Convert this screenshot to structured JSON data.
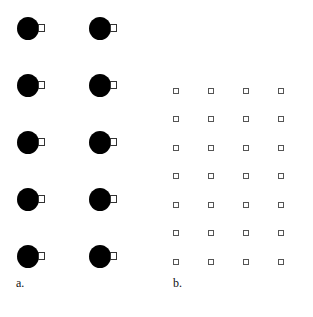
{
  "panel_a": {
    "label": "a.",
    "description": "Two columns of five filled black circles, each with a small open square attached on its right side",
    "circle_color": "#000000",
    "columns_x": [
      28,
      100
    ],
    "rows_y": [
      28,
      85,
      142,
      199,
      256
    ]
  },
  "panel_b": {
    "label": "b.",
    "description": "A 4 x 7 grid of small open squares",
    "square_color": "#555555",
    "columns_x": [
      176,
      211,
      246,
      281
    ],
    "rows_y": [
      91,
      119,
      148,
      176,
      205,
      233,
      262
    ]
  }
}
